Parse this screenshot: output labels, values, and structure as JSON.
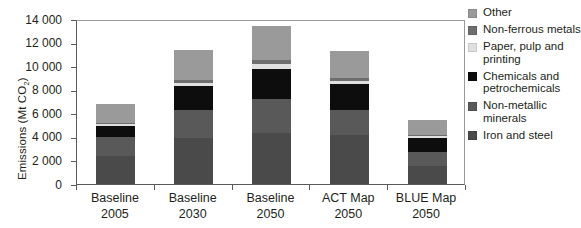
{
  "chart_data": {
    "type": "bar",
    "stacked": true,
    "title": "",
    "xlabel": "",
    "ylabel": "Emissions (Mt CO2)",
    "ylabel_main": "Emissions (Mt CO",
    "ylabel_sub": "2",
    "ylabel_close": ")",
    "ylim": [
      0,
      14000
    ],
    "ytick_labels": [
      "14 000",
      "12 000",
      "10 000",
      "8 000",
      "6 000",
      "4 000",
      "2 000",
      "0"
    ],
    "ytick_values": [
      14000,
      12000,
      10000,
      8000,
      6000,
      4000,
      2000,
      0
    ],
    "grid": false,
    "legend_position": "right",
    "categories": [
      "Baseline 2005",
      "Baseline 2030",
      "Baseline 2050",
      "ACT Map 2050",
      "BLUE Map 2050"
    ],
    "category_lines": [
      {
        "line1": "Baseline",
        "line2": "2005"
      },
      {
        "line1": "Baseline",
        "line2": "2030"
      },
      {
        "line1": "Baseline",
        "line2": "2050"
      },
      {
        "line1": "ACT Map",
        "line2": "2050"
      },
      {
        "line1": "BLUE Map",
        "line2": "2050"
      }
    ],
    "series": [
      {
        "name": "Iron and steel",
        "color": "#4a4a4a",
        "values": [
          2400,
          3900,
          4300,
          4200,
          1500
        ]
      },
      {
        "name": "Non-metallic minerals",
        "color": "#595959",
        "values": [
          1600,
          2400,
          2900,
          2100,
          1200
        ]
      },
      {
        "name": "Chemicals and petrochemicals",
        "color": "#0d0d0d",
        "values": [
          900,
          2000,
          2600,
          2200,
          1200
        ]
      },
      {
        "name": "Paper, pulp and printing",
        "color": "#e0e0e0",
        "values": [
          150,
          250,
          350,
          250,
          150
        ]
      },
      {
        "name": "Non-ferrous metals",
        "color": "#6e6e6e",
        "values": [
          150,
          250,
          350,
          250,
          150
        ]
      },
      {
        "name": "Other",
        "color": "#9a9a9a",
        "values": [
          1600,
          2600,
          2900,
          2300,
          1200
        ]
      }
    ],
    "totals": [
      6800,
      11400,
      13400,
      11300,
      5400
    ]
  },
  "legend": {
    "items": [
      {
        "label": "Other",
        "color": "#9a9a9a",
        "swatch_name": "legend-swatch-other"
      },
      {
        "label": "Non-ferrous metals",
        "color": "#6e6e6e",
        "swatch_name": "legend-swatch-non-ferrous-metals"
      },
      {
        "label": "Paper, pulp and printing",
        "color": "#e0e0e0",
        "swatch_name": "legend-swatch-paper-pulp-and-printing"
      },
      {
        "label": "Chemicals and petrochemicals",
        "color": "#0d0d0d",
        "swatch_name": "legend-swatch-chemicals-and-petrochemicals"
      },
      {
        "label": "Non-metallic minerals",
        "color": "#595959",
        "swatch_name": "legend-swatch-non-metallic-minerals"
      },
      {
        "label": "Iron and steel",
        "color": "#4a4a4a",
        "swatch_name": "legend-swatch-iron-and-steel"
      }
    ]
  },
  "colors": {
    "axis": "#5a5a5a",
    "frame": "#9a9a9a",
    "text": "#231f20",
    "background": "#ffffff"
  }
}
